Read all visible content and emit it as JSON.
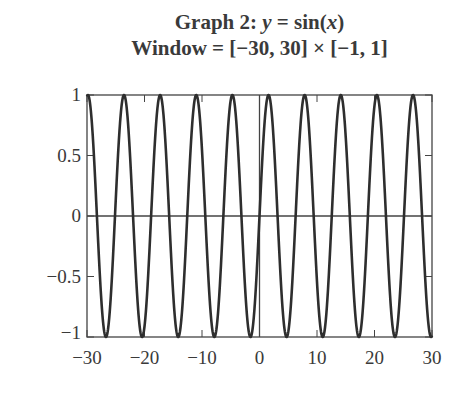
{
  "header": {
    "title_line1_prefix": "Graph 2: ",
    "title_line1_y": "y",
    "title_line1_eq": " = sin(",
    "title_line1_x": "x",
    "title_line1_close": ")",
    "title_line2": "Window = [−30, 30] × [−1, 1]"
  },
  "colors": {
    "curve": "#2e2e2e",
    "axes": "#444444",
    "text": "#3a3a3a"
  },
  "chart_data": {
    "type": "line",
    "title": "Graph 2: y = sin(x)",
    "subtitle": "Window = [−30, 30] × [−1, 1]",
    "function": "sin(x)",
    "xlabel": "",
    "ylabel": "",
    "xlim": [
      -30,
      30
    ],
    "ylim": [
      -1,
      1
    ],
    "x_ticks": [
      -30,
      -20,
      -10,
      0,
      10,
      20,
      30
    ],
    "x_tick_labels": [
      "−30",
      "−20",
      "−10",
      "0",
      "10",
      "20",
      "30"
    ],
    "y_ticks": [
      -1,
      -0.5,
      0,
      0.5,
      1
    ],
    "y_tick_labels": [
      "−1",
      "−0.5",
      "0",
      "0.5",
      "1"
    ],
    "grid": false,
    "legend": null,
    "series": [
      {
        "name": "y = sin(x)",
        "x": [
          -30,
          -25,
          -20,
          -15,
          -10,
          -5,
          0,
          5,
          10,
          15,
          20,
          25,
          30
        ],
        "values": [
          0.988,
          0.132,
          -0.913,
          -0.65,
          0.544,
          0.959,
          0.0,
          -0.959,
          -0.544,
          0.65,
          0.913,
          -0.132,
          -0.988
        ]
      }
    ]
  }
}
